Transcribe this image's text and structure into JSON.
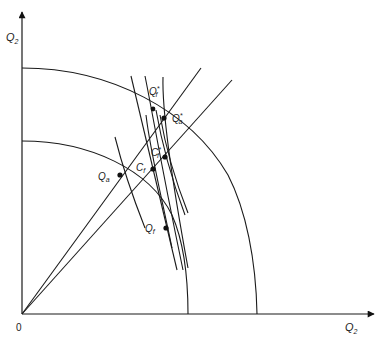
{
  "diagram": {
    "type": "production-possibility diagram",
    "axes": {
      "y_label": "Q",
      "y_label_sub": "2",
      "x_label": "Q",
      "x_label_sub": "2",
      "origin_label": "0"
    },
    "frontiers": [
      {
        "name": "inner-frontier"
      },
      {
        "name": "outer-frontier"
      }
    ],
    "rays": [
      {
        "name": "ray-upper"
      },
      {
        "name": "ray-lower"
      }
    ],
    "points": [
      {
        "id": "Qa",
        "label": "Q",
        "sub": "a",
        "star": false
      },
      {
        "id": "Qf",
        "label": "Q",
        "sub": "f",
        "star": false
      },
      {
        "id": "Cf",
        "label": "C",
        "sub": "f",
        "star": false
      },
      {
        "id": "Cf_star",
        "label": "C",
        "sub": "f",
        "star": true
      },
      {
        "id": "Qf_star",
        "label": "Q",
        "sub": "f",
        "star": true
      },
      {
        "id": "Qa_star",
        "label": "Q",
        "sub": "a",
        "star": true
      }
    ],
    "star_glyph": "*"
  }
}
